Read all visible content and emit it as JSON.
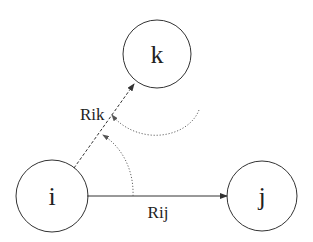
{
  "diagram": {
    "nodes": [
      {
        "id": "i",
        "label": "i"
      },
      {
        "id": "j",
        "label": "j"
      },
      {
        "id": "k",
        "label": "k"
      }
    ],
    "edges": [
      {
        "from": "i",
        "to": "j",
        "label": "Rij",
        "style": "solid"
      },
      {
        "from": "i",
        "to": "k",
        "label": "Rik",
        "style": "dashed"
      }
    ],
    "rotation_arcs": [
      {
        "name": "angle-arc-rij-to-rik",
        "style": "dotted"
      },
      {
        "name": "outer-rotation-arc",
        "style": "dotted"
      }
    ]
  },
  "colors": {
    "stroke": "#333333",
    "dotted": "#666666",
    "background": "#ffffff"
  }
}
